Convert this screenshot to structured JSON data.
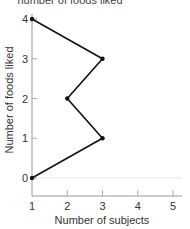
{
  "chart_data": {
    "type": "line",
    "title": "number of foods liked",
    "xlabel": "Number of subjects",
    "ylabel": "Number of foods liked",
    "x_ticks": [
      "1",
      "2",
      "3",
      "4",
      "5"
    ],
    "y_ticks": [
      "0",
      "1",
      "2",
      "3",
      "4"
    ],
    "xlim": [
      1,
      5
    ],
    "ylim": [
      0,
      4
    ],
    "grid": false,
    "series": [
      {
        "name": "frequency polygon",
        "points": [
          {
            "x": 1,
            "y": 0
          },
          {
            "x": 3,
            "y": 1
          },
          {
            "x": 2,
            "y": 2
          },
          {
            "x": 3,
            "y": 3
          },
          {
            "x": 1,
            "y": 4
          }
        ]
      }
    ]
  },
  "colors": {
    "line": "#111111",
    "axis": "#999999",
    "text": "#333333"
  }
}
